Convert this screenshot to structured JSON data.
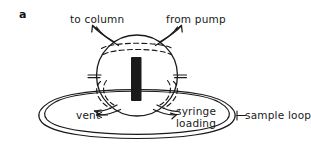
{
  "figure": {
    "panel_letter": "a",
    "type": "schematic-diagram",
    "background_color": "#ffffff",
    "line_color": "#1a1a1a",
    "rotor_color": "#1a1a1a"
  },
  "labels": {
    "to_column": "to column",
    "from_pump": "from pump",
    "vent": "vent",
    "syringe_loading_line1": "syringe",
    "syringe_loading_line2": "loading",
    "sample_loop": "sample loop"
  },
  "parts": {
    "valve_body": "valve-body-circle",
    "rotor": "rotor-bar",
    "internal_channel_top": "dashed-channel-top",
    "internal_channel_left": "dashed-channel-left",
    "internal_channel_right": "dashed-channel-right",
    "port_to_column": "port-tube-upper-left",
    "port_from_pump": "port-tube-upper-right",
    "port_vent": "port-tube-lower-left",
    "port_syringe": "port-tube-lower-right",
    "sample_loop_tube": "sample-loop-ellipse"
  }
}
